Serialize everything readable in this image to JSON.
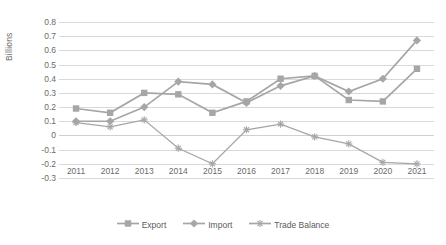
{
  "chart_data": {
    "type": "line",
    "title": "",
    "xlabel": "",
    "ylabel": "Billions",
    "categories": [
      "2011",
      "2012",
      "2013",
      "2014",
      "2015",
      "2016",
      "2017",
      "2018",
      "2019",
      "2020",
      "2021"
    ],
    "series": [
      {
        "name": "Export",
        "color": "#a6a6a6",
        "marker": "square",
        "values": [
          0.19,
          0.16,
          0.3,
          0.29,
          0.16,
          0.24,
          0.4,
          0.42,
          0.25,
          0.24,
          0.47
        ]
      },
      {
        "name": "Import",
        "color": "#a6a6a6",
        "marker": "diamond",
        "values": [
          0.1,
          0.1,
          0.2,
          0.38,
          0.36,
          0.23,
          0.35,
          0.42,
          0.31,
          0.4,
          0.67
        ]
      },
      {
        "name": "Trade Balance",
        "color": "#a6a6a6",
        "marker": "star",
        "values": [
          0.09,
          0.06,
          0.11,
          -0.09,
          -0.2,
          0.04,
          0.08,
          -0.01,
          -0.06,
          -0.19,
          -0.2
        ]
      }
    ],
    "ylim": [
      -0.3,
      0.8
    ],
    "yticks": [
      "0.8",
      "0.7",
      "0.6",
      "0.5",
      "0.4",
      "0.3",
      "0.2",
      "0.1",
      "0",
      "-0.1",
      "-0.2",
      "-0.3"
    ],
    "ytick_values": [
      0.8,
      0.7,
      0.6,
      0.5,
      0.4,
      0.3,
      0.2,
      0.1,
      0,
      -0.1,
      -0.2,
      -0.3
    ],
    "grid": true,
    "legend_position": "bottom"
  }
}
